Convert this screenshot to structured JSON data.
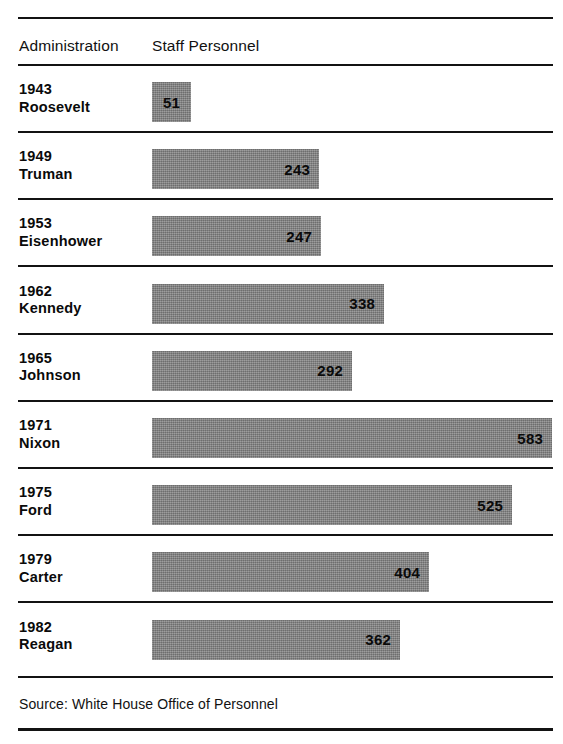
{
  "figure": {
    "headers": {
      "administration": "Administration",
      "staff_personnel": "Staff Personnel"
    },
    "source_note": "Source: White House Office of Personnel",
    "bar_color": "#868686",
    "rule_color": "#131313",
    "background": "#ffffff"
  },
  "chart_data": {
    "type": "bar",
    "orientation": "horizontal",
    "title": "",
    "subtitle": "",
    "xlabel": "Staff Personnel",
    "ylabel": "Administration",
    "grid": false,
    "legend": null,
    "axis_visible": false,
    "value_labels_inside_bars": true,
    "xlim": [
      0,
      583
    ],
    "categories": [
      "1943 Roosevelt",
      "1949 Truman",
      "1953 Eisenhower",
      "1962 Kennedy",
      "1965 Johnson",
      "1971 Nixon",
      "1975 Ford",
      "1979 Carter",
      "1982 Reagan"
    ],
    "values": [
      51,
      243,
      247,
      338,
      292,
      583,
      525,
      404,
      362
    ],
    "source": "Source: White House Office of Personnel"
  },
  "rows": [
    {
      "year": "1943",
      "name": "Roosevelt",
      "value": "51",
      "value_num": 51
    },
    {
      "year": "1949",
      "name": "Truman",
      "value": "243",
      "value_num": 243
    },
    {
      "year": "1953",
      "name": "Eisenhower",
      "value": "247",
      "value_num": 247
    },
    {
      "year": "1962",
      "name": "Kennedy",
      "value": "338",
      "value_num": 338
    },
    {
      "year": "1965",
      "name": "Johnson",
      "value": "292",
      "value_num": 292
    },
    {
      "year": "1971",
      "name": "Nixon",
      "value": "583",
      "value_num": 583
    },
    {
      "year": "1975",
      "name": "Ford",
      "value": "525",
      "value_num": 525
    },
    {
      "year": "1979",
      "name": "Carter",
      "value": "404",
      "value_num": 404
    },
    {
      "year": "1982",
      "name": "Reagan",
      "value": "362",
      "value_num": 362
    }
  ]
}
